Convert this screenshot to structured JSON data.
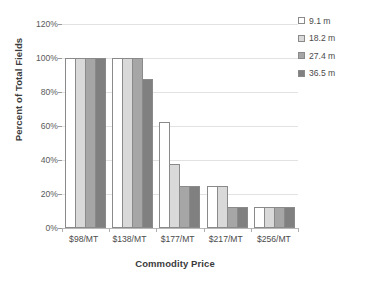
{
  "chart_data": {
    "type": "bar",
    "title": "",
    "subtitle": "",
    "xlabel": "Commodity Price",
    "ylabel": "Percent of Total Fields",
    "categories": [
      "$98/MT",
      "$138/MT",
      "$177/MT",
      "$217/MT",
      "$256/MT"
    ],
    "series": [
      {
        "name": "9.1 m",
        "color": "#ffffff",
        "values": [
          100,
          100,
          62.5,
          25,
          12.5
        ]
      },
      {
        "name": "18.2 m",
        "color": "#d9d9d9",
        "values": [
          100,
          100,
          37.5,
          25,
          12.5
        ]
      },
      {
        "name": "27.4 m",
        "color": "#a6a6a6",
        "values": [
          100,
          100,
          25,
          12.5,
          12.5
        ]
      },
      {
        "name": "36.5 m",
        "color": "#808080",
        "values": [
          100,
          87.5,
          25,
          12.5,
          12.5
        ]
      }
    ],
    "ylim": [
      0,
      120
    ],
    "yticks": [
      0,
      20,
      40,
      60,
      80,
      100,
      120
    ],
    "ytick_labels": [
      "0%",
      "20%",
      "40%",
      "60%",
      "80%",
      "100%",
      "120%"
    ],
    "grid": true,
    "grid_axis": "y",
    "legend_position": "top-right",
    "bar_edge_color": "#8a8a8a",
    "value_unit": "percent"
  }
}
